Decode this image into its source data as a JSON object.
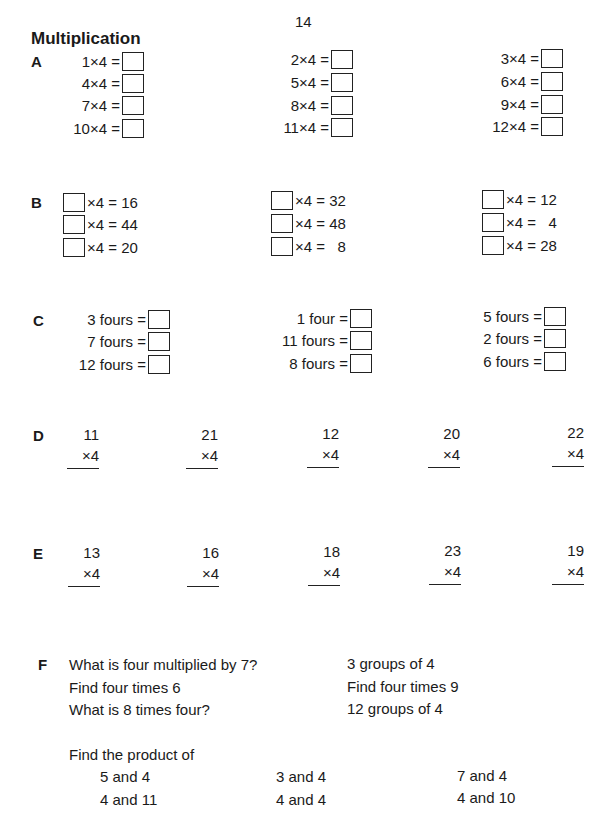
{
  "page_number": "14",
  "title": "Multiplication",
  "sections": {
    "A": {
      "label": "A",
      "columns": [
        [
          "1×4 =",
          "4×4 =",
          "7×4 =",
          "10×4 ="
        ],
        [
          "2×4 =",
          "5×4 =",
          "8×4 =",
          "11×4 ="
        ],
        [
          "3×4 =",
          "6×4 =",
          "9×4 =",
          "12×4 ="
        ]
      ]
    },
    "B": {
      "label": "B",
      "columns": [
        [
          "×4 = 16",
          "×4 = 44",
          "×4 = 20"
        ],
        [
          "×4 = 32",
          "×4 = 48",
          "×4 =   8"
        ],
        [
          "×4 = 12",
          "×4 =   4",
          "×4 = 28"
        ]
      ]
    },
    "C": {
      "label": "C",
      "columns": [
        [
          "3 fours =",
          "7 fours =",
          "12 fours ="
        ],
        [
          "1 four =",
          "11 fours =",
          "8 fours ="
        ],
        [
          "5 fours =",
          "2 fours =",
          "6 fours ="
        ]
      ]
    },
    "D": {
      "label": "D",
      "problems": [
        {
          "top": "11",
          "mult": "×4"
        },
        {
          "top": "21",
          "mult": "×4"
        },
        {
          "top": "12",
          "mult": "×4"
        },
        {
          "top": "20",
          "mult": "×4"
        },
        {
          "top": "22",
          "mult": "×4"
        }
      ]
    },
    "E": {
      "label": "E",
      "problems": [
        {
          "top": "13",
          "mult": "×4"
        },
        {
          "top": "16",
          "mult": "×4"
        },
        {
          "top": "18",
          "mult": "×4"
        },
        {
          "top": "23",
          "mult": "×4"
        },
        {
          "top": "19",
          "mult": "×4"
        }
      ]
    },
    "F": {
      "label": "F",
      "left_questions": [
        "What is four multiplied by 7?",
        "Find four times 6",
        "What is 8 times four?"
      ],
      "right_questions": [
        "3 groups of 4",
        "Find four times 9",
        "12 groups of 4"
      ],
      "product_heading": "Find the product of",
      "product_columns": [
        [
          "5 and 4",
          "4 and 11"
        ],
        [
          "3 and 4",
          "4 and 4"
        ],
        [
          "7 and 4",
          "4 and 10"
        ]
      ]
    }
  }
}
